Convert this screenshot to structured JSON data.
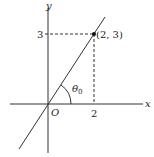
{
  "diagram": {
    "axes": {
      "x_label": "x",
      "y_label": "y",
      "origin_label": "O"
    },
    "line": {
      "description": "line through origin and point (2, 3)",
      "slope": 1.5
    },
    "point": {
      "label": "(2, 3)",
      "x": 2,
      "y": 3
    },
    "ticks": {
      "x_tick_label": "2",
      "y_tick_label": "3"
    },
    "angle": {
      "label_base": "θ",
      "label_sub": "0"
    },
    "colors": {
      "stroke": "#333333",
      "text": "#222222"
    }
  }
}
